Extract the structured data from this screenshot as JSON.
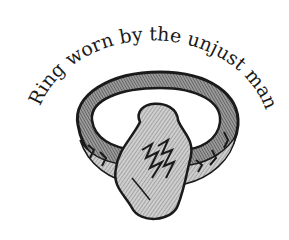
{
  "illustration": {
    "caption": "Ring worn by the unjust man",
    "subject_icon": "ring-illustration",
    "colors": {
      "background": "#ffffff",
      "ink": "#1a1a1a",
      "shade": "#8a8a8a",
      "light": "#d6d6d6"
    }
  }
}
